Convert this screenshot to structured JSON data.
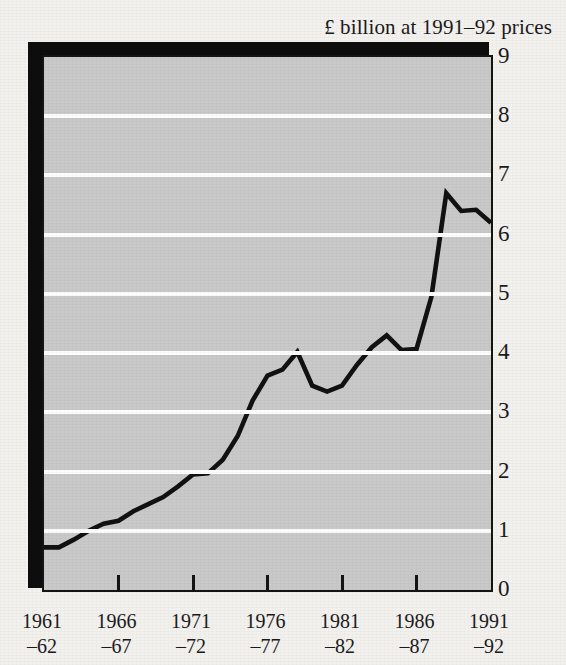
{
  "title": "£ billion at 1991–92 prices",
  "colors": {
    "plot_background": "#c9c9c9",
    "page_background": "#f2f1ee",
    "line": "#111111",
    "gridline": "#fdfdfb",
    "frame": "#141414",
    "shadow": "#0d0d0d"
  },
  "axes": {
    "y_ticks": [
      "0",
      "1",
      "2",
      "3",
      "4",
      "5",
      "6",
      "7",
      "8",
      "9"
    ],
    "x_ticks": [
      {
        "year1": "1961",
        "year2": "–62"
      },
      {
        "year1": "1966",
        "year2": "–67"
      },
      {
        "year1": "1971",
        "year2": "–72"
      },
      {
        "year1": "1976",
        "year2": "–77"
      },
      {
        "year1": "1981",
        "year2": "–82"
      },
      {
        "year1": "1986",
        "year2": "–87"
      },
      {
        "year1": "1991",
        "year2": "–92"
      }
    ]
  },
  "chart_data": {
    "type": "line",
    "title": "£ billion at 1991–92 prices",
    "xlabel": "",
    "ylabel": "£ billion at 1991–92 prices",
    "ylim": [
      0,
      9
    ],
    "grid": true,
    "legend": "none",
    "x": [
      "1961–62",
      "1962–63",
      "1963–64",
      "1964–65",
      "1965–66",
      "1966–67",
      "1967–68",
      "1968–69",
      "1969–70",
      "1970–71",
      "1971–72",
      "1972–73",
      "1973–74",
      "1974–75",
      "1975–76",
      "1976–77",
      "1977–78",
      "1978–79",
      "1979–80",
      "1980–81",
      "1981–82",
      "1982–83",
      "1983–84",
      "1984–85",
      "1985–86",
      "1986–87",
      "1987–88",
      "1988–89",
      "1989–90",
      "1990–91",
      "1991–92"
    ],
    "tick_labels": [
      "1961–62",
      "1966–67",
      "1971–72",
      "1976–77",
      "1981–82",
      "1986–87",
      "1991–92"
    ],
    "values": [
      0.72,
      0.72,
      0.85,
      1.0,
      1.12,
      1.17,
      1.33,
      1.45,
      1.57,
      1.75,
      1.95,
      1.97,
      2.2,
      2.6,
      3.2,
      3.62,
      3.72,
      4.02,
      3.45,
      3.35,
      3.45,
      3.8,
      4.1,
      4.3,
      4.05,
      4.07,
      4.95,
      6.7,
      6.4,
      6.42,
      6.2
    ],
    "peaks": [
      {
        "x": "1978–79",
        "y": 4.02
      },
      {
        "x": "1990–91",
        "y": 8.08
      }
    ],
    "start_value": 0.72,
    "end_value": 6.2,
    "series_note": "single series"
  }
}
